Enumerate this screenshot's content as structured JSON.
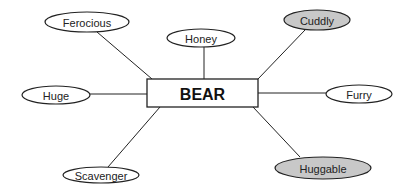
{
  "diagram": {
    "type": "word-web",
    "center": {
      "label": "BEAR",
      "box": {
        "x": 147,
        "y": 79,
        "width": 111,
        "height": 28
      }
    },
    "nodes": [
      {
        "id": "ferocious",
        "label": "Ferocious",
        "cx": 87,
        "cy": 22,
        "rx": 42,
        "ry": 10,
        "fill": "#ffffff",
        "line": [
          97,
          32,
          152,
          79
        ]
      },
      {
        "id": "honey",
        "label": "Honey",
        "cx": 201,
        "cy": 38,
        "rx": 34,
        "ry": 9,
        "fill": "#ffffff",
        "line": [
          204,
          47,
          204,
          79
        ]
      },
      {
        "id": "cuddly",
        "label": "Cuddly",
        "cx": 317,
        "cy": 20,
        "rx": 33,
        "ry": 10,
        "fill": "#c8c8c8",
        "line": [
          305,
          30,
          258,
          79
        ]
      },
      {
        "id": "huge",
        "label": "Huge",
        "cx": 56,
        "cy": 95,
        "rx": 34,
        "ry": 9,
        "fill": "#ffffff",
        "line": [
          90,
          94,
          147,
          94
        ]
      },
      {
        "id": "furry",
        "label": "Furry",
        "cx": 359,
        "cy": 94,
        "rx": 33,
        "ry": 9,
        "fill": "#ffffff",
        "line": [
          258,
          93,
          326,
          93
        ]
      },
      {
        "id": "scavenger",
        "label": "Scavenger",
        "cx": 101,
        "cy": 175,
        "rx": 38,
        "ry": 8,
        "fill": "#ffffff",
        "line": [
          160,
          107,
          108,
          167
        ]
      },
      {
        "id": "huggable",
        "label": "Huggable",
        "cx": 323,
        "cy": 168,
        "rx": 48,
        "ry": 11,
        "fill": "#c8c8c8",
        "line": [
          253,
          107,
          300,
          157
        ]
      }
    ],
    "colors": {
      "stroke": "#222222",
      "highlight_fill": "#c8c8c8",
      "plain_fill": "#ffffff"
    }
  }
}
